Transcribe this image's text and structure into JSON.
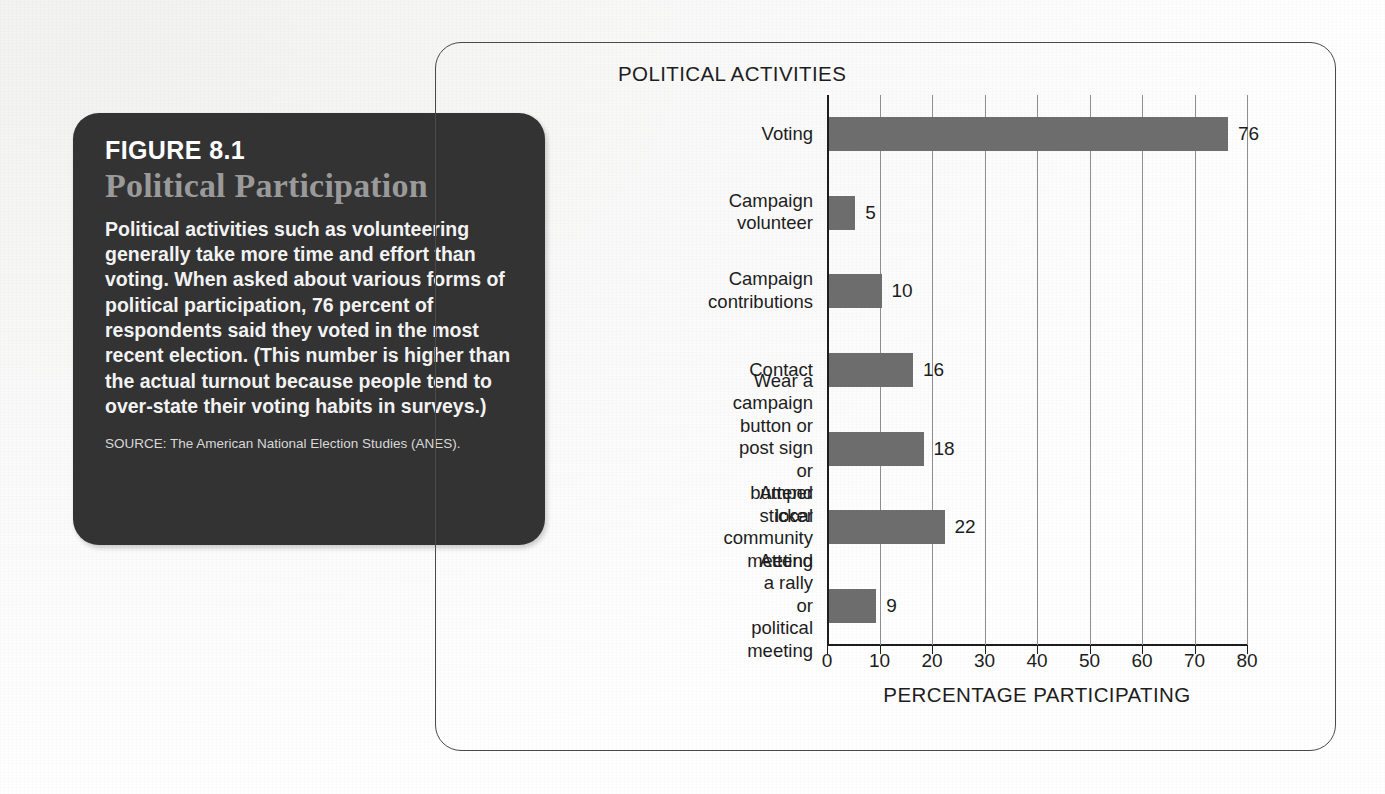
{
  "figure": {
    "number": "FIGURE 8.1",
    "title": "Political Participation",
    "body": "Political activities such as volunteering generally take more time and effort than voting. When asked about various forms of political participation, 76 percent of respondents said they voted in the most recent election. (This number is higher than the actual turnout because people tend to over-state their voting habits in surveys.)",
    "source": "SOURCE: The American National Election Studies (ANES).",
    "card_color": "#333333",
    "title_color": "#9a9a9a"
  },
  "chart_data": {
    "type": "bar",
    "orientation": "horizontal",
    "title": "POLITICAL ACTIVITIES",
    "xlabel": "PERCENTAGE PARTICIPATING",
    "ylabel": "",
    "xlim": [
      0,
      80
    ],
    "xticks": [
      0,
      10,
      20,
      30,
      40,
      50,
      60,
      70,
      80
    ],
    "grid": "vertical",
    "legend": "none",
    "bar_color": "#6d6d6d",
    "categories": [
      "Voting",
      "Campaign volunteer",
      "Campaign contributions",
      "Contact",
      "Wear a campaign button or\npost sign or bumper sticker",
      "Attend local community meeting",
      "Attend a rally or political meeting"
    ],
    "values": [
      76,
      5,
      10,
      16,
      18,
      22,
      9
    ],
    "value_labels": [
      "76",
      "5",
      "10",
      "16",
      "18",
      "22",
      "9"
    ]
  }
}
